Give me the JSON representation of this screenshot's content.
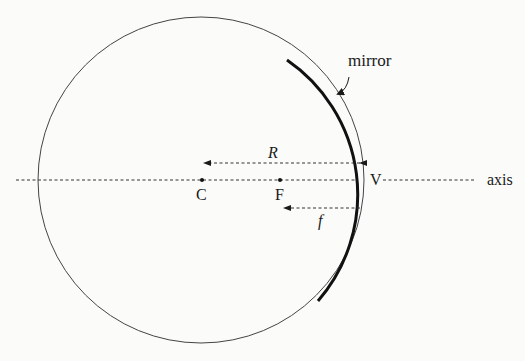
{
  "diagram": {
    "labels": {
      "mirror": "mirror",
      "radius": "R",
      "center": "C",
      "focal_point": "F",
      "vertex": "V",
      "focal_length": "f",
      "axis": "axis"
    },
    "geometry": {
      "circle_center": [
        201,
        180
      ],
      "circle_radius": 163,
      "mirror_arc_start": [
        287,
        60
      ],
      "mirror_arc_end": [
        317,
        301
      ],
      "vertex_point": [
        364,
        180
      ],
      "focal_point": [
        281,
        180
      ],
      "axis_y": 180
    },
    "colors": {
      "background": "#fbfbfa",
      "stroke": "#1a1a1a",
      "circle_stroke": "#444444"
    }
  }
}
